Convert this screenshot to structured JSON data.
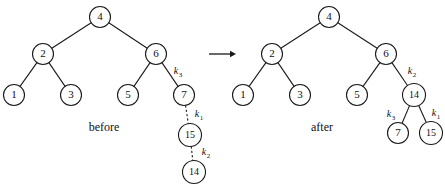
{
  "figure": {
    "background_color": "#ffffff",
    "stroke_color": "#1a1a1a",
    "text_color": "#111111"
  },
  "transition_arrow": {
    "name": "right-arrow",
    "x1": 209,
    "y1": 54,
    "x2": 236,
    "y2": 54
  },
  "panels": [
    {
      "id": "before",
      "caption": "before",
      "caption_x": 104,
      "caption_y": 128,
      "nodes": [
        {
          "id": "b4",
          "label": "4",
          "cx": 100,
          "cy": 17,
          "r": 10.5,
          "size": "normal"
        },
        {
          "id": "b2",
          "label": "2",
          "cx": 43,
          "cy": 54,
          "r": 10.5,
          "size": "normal"
        },
        {
          "id": "b6",
          "label": "6",
          "cx": 156,
          "cy": 54,
          "r": 10.5,
          "size": "normal"
        },
        {
          "id": "b1",
          "label": "1",
          "cx": 14,
          "cy": 95,
          "r": 10.5,
          "size": "normal"
        },
        {
          "id": "b3",
          "label": "3",
          "cx": 71,
          "cy": 95,
          "r": 10.5,
          "size": "normal"
        },
        {
          "id": "b5",
          "label": "5",
          "cx": 128,
          "cy": 95,
          "r": 10.5,
          "size": "normal"
        },
        {
          "id": "b7",
          "label": "7",
          "cx": 184,
          "cy": 95,
          "r": 10.5,
          "size": "normal"
        },
        {
          "id": "b15",
          "label": "15",
          "cx": 190,
          "cy": 135,
          "r": 11.5,
          "size": "small"
        },
        {
          "id": "b14",
          "label": "14",
          "cx": 194,
          "cy": 172,
          "r": 11.5,
          "size": "small"
        }
      ],
      "edges": [
        {
          "from": "b4",
          "to": "b2",
          "style": "solid",
          "key": null
        },
        {
          "from": "b4",
          "to": "b6",
          "style": "solid",
          "key": null
        },
        {
          "from": "b2",
          "to": "b1",
          "style": "solid",
          "key": null
        },
        {
          "from": "b2",
          "to": "b3",
          "style": "solid",
          "key": null
        },
        {
          "from": "b6",
          "to": "b5",
          "style": "solid",
          "key": null
        },
        {
          "from": "b6",
          "to": "b7",
          "style": "solid",
          "key": "k",
          "key_sub": "3",
          "key_x": 178,
          "key_y": 72
        },
        {
          "from": "b7",
          "to": "b15",
          "style": "dashed",
          "key": "k",
          "key_sub": "1",
          "key_x": 199,
          "key_y": 115
        },
        {
          "from": "b15",
          "to": "b14",
          "style": "dashed",
          "key": "k",
          "key_sub": "2",
          "key_x": 206,
          "key_y": 153
        }
      ]
    },
    {
      "id": "after",
      "caption": "after",
      "caption_x": 322,
      "caption_y": 128,
      "nodes": [
        {
          "id": "a4",
          "label": "4",
          "cx": 329,
          "cy": 17,
          "r": 10.5,
          "size": "normal"
        },
        {
          "id": "a2",
          "label": "2",
          "cx": 272,
          "cy": 54,
          "r": 10.5,
          "size": "normal"
        },
        {
          "id": "a6",
          "label": "6",
          "cx": 386,
          "cy": 54,
          "r": 10.5,
          "size": "normal"
        },
        {
          "id": "a1",
          "label": "1",
          "cx": 243,
          "cy": 95,
          "r": 10.5,
          "size": "normal"
        },
        {
          "id": "a3",
          "label": "3",
          "cx": 300,
          "cy": 95,
          "r": 10.5,
          "size": "normal"
        },
        {
          "id": "a5",
          "label": "5",
          "cx": 357,
          "cy": 95,
          "r": 10.5,
          "size": "normal"
        },
        {
          "id": "a14",
          "label": "14",
          "cx": 414,
          "cy": 95,
          "r": 11.5,
          "size": "small"
        },
        {
          "id": "a7",
          "label": "7",
          "cx": 398,
          "cy": 133,
          "r": 10.5,
          "size": "normal"
        },
        {
          "id": "a15",
          "label": "15",
          "cx": 431,
          "cy": 133,
          "r": 11.5,
          "size": "small"
        }
      ],
      "edges": [
        {
          "from": "a4",
          "to": "a2",
          "style": "solid",
          "key": null
        },
        {
          "from": "a4",
          "to": "a6",
          "style": "solid",
          "key": null
        },
        {
          "from": "a2",
          "to": "a1",
          "style": "solid",
          "key": null
        },
        {
          "from": "a2",
          "to": "a3",
          "style": "solid",
          "key": null
        },
        {
          "from": "a6",
          "to": "a5",
          "style": "solid",
          "key": null
        },
        {
          "from": "a6",
          "to": "a14",
          "style": "solid",
          "key": "k",
          "key_sub": "2",
          "key_x": 412,
          "key_y": 72
        },
        {
          "from": "a14",
          "to": "a7",
          "style": "solid",
          "key": "k",
          "key_sub": "3",
          "key_x": 391,
          "key_y": 115
        },
        {
          "from": "a14",
          "to": "a15",
          "style": "solid",
          "key": "k",
          "key_sub": "1",
          "key_x": 436,
          "key_y": 114
        }
      ]
    }
  ]
}
